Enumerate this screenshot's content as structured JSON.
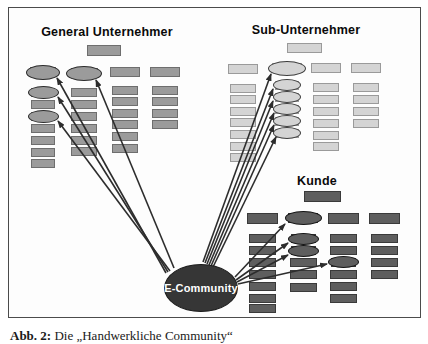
{
  "caption": {
    "label": "Abb. 2:",
    "text": " Die „Handwerkliche Community“"
  },
  "colors": {
    "page_bg": "#ffffff",
    "frame_border": "#4b4b4b",
    "frame_bg": "#fdfdfd",
    "arrow": "#2d2d2d"
  },
  "diagram": {
    "hub": {
      "label": "E-Community",
      "cx": 201,
      "cy": 288,
      "rx": 37,
      "ry": 24,
      "fill": "#363636",
      "border": "#1c1c1c",
      "text_color": "#ffffff"
    },
    "groups": [
      {
        "id": "general-unternehmer",
        "title": "General Unternehmer",
        "title_cx": 107,
        "title_top": 25,
        "fill": "#9b9b9b",
        "rect_border": "#6e6e6e",
        "ellipse_border": "#2b2b2b",
        "header": {
          "x": 87,
          "y": 45,
          "w": 34,
          "h": 11
        },
        "columns": [
          {
            "cx": 43,
            "nodes": [
              {
                "y": 72,
                "t": "e",
                "w": 26,
                "h": 10,
                "ew": 34,
                "eh": 15
              },
              {
                "y": 92.5,
                "t": "e",
                "w": 24,
                "h": 9,
                "ew": 31,
                "eh": 13
              },
              {
                "y": 104,
                "t": "r",
                "w": 24,
                "h": 9
              },
              {
                "y": 116,
                "t": "e",
                "w": 24,
                "h": 9,
                "ew": 31,
                "eh": 13
              },
              {
                "y": 128.5,
                "t": "r",
                "w": 24,
                "h": 9
              },
              {
                "y": 140.5,
                "t": "r",
                "w": 24,
                "h": 9
              },
              {
                "y": 152.5,
                "t": "r",
                "w": 24,
                "h": 9
              },
              {
                "y": 163.5,
                "t": "r",
                "w": 24,
                "h": 9
              }
            ]
          },
          {
            "cx": 84,
            "nodes": [
              {
                "y": 73,
                "t": "e",
                "w": 27,
                "h": 10,
                "ew": 36,
                "eh": 15
              },
              {
                "y": 92.5,
                "t": "r",
                "w": 26,
                "h": 9
              },
              {
                "y": 104,
                "t": "r",
                "w": 26,
                "h": 9
              },
              {
                "y": 116,
                "t": "r",
                "w": 26,
                "h": 9
              },
              {
                "y": 128,
                "t": "r",
                "w": 26,
                "h": 9
              },
              {
                "y": 140,
                "t": "r",
                "w": 26,
                "h": 9
              },
              {
                "y": 151.5,
                "t": "r",
                "w": 26,
                "h": 9
              }
            ]
          },
          {
            "cx": 125,
            "nodes": [
              {
                "y": 71.5,
                "t": "r",
                "w": 30,
                "h": 10
              },
              {
                "y": 90,
                "t": "r",
                "w": 26,
                "h": 9
              },
              {
                "y": 101.5,
                "t": "r",
                "w": 26,
                "h": 9
              },
              {
                "y": 113,
                "t": "r",
                "w": 26,
                "h": 9
              },
              {
                "y": 124.5,
                "t": "r",
                "w": 26,
                "h": 9
              },
              {
                "y": 136.5,
                "t": "r",
                "w": 26,
                "h": 9
              },
              {
                "y": 148.5,
                "t": "r",
                "w": 26,
                "h": 9
              }
            ]
          },
          {
            "cx": 165,
            "nodes": [
              {
                "y": 71.5,
                "t": "r",
                "w": 30,
                "h": 10
              },
              {
                "y": 90,
                "t": "r",
                "w": 26,
                "h": 9
              },
              {
                "y": 101.5,
                "t": "r",
                "w": 26,
                "h": 9
              },
              {
                "y": 113,
                "t": "r",
                "w": 26,
                "h": 9
              },
              {
                "y": 124.5,
                "t": "r",
                "w": 26,
                "h": 9
              }
            ]
          }
        ]
      },
      {
        "id": "sub-unternehmer",
        "title": "Sub-Unternehmer",
        "title_cx": 306,
        "title_top": 23,
        "fill": "#d4d4d4",
        "rect_border": "#9a9a9a",
        "ellipse_border": "#3e3e3e",
        "header": {
          "x": 287,
          "y": 43,
          "w": 35,
          "h": 10
        },
        "columns": [
          {
            "cx": 243,
            "nodes": [
              {
                "y": 69,
                "t": "r",
                "w": 30,
                "h": 10
              },
              {
                "y": 88,
                "t": "r",
                "w": 26,
                "h": 9
              },
              {
                "y": 99.5,
                "t": "r",
                "w": 26,
                "h": 9
              },
              {
                "y": 111,
                "t": "r",
                "w": 26,
                "h": 9
              },
              {
                "y": 122.5,
                "t": "r",
                "w": 26,
                "h": 9
              },
              {
                "y": 134.5,
                "t": "r",
                "w": 26,
                "h": 9
              },
              {
                "y": 146,
                "t": "r",
                "w": 26,
                "h": 9
              },
              {
                "y": 157.5,
                "t": "r",
                "w": 26,
                "h": 9
              }
            ]
          },
          {
            "cx": 287,
            "nodes": [
              {
                "y": 68,
                "t": "e",
                "w": 30,
                "h": 10,
                "ew": 38,
                "eh": 15
              },
              {
                "y": 85,
                "t": "e",
                "w": 24,
                "h": 9,
                "ew": 28,
                "eh": 12
              },
              {
                "y": 97,
                "t": "e",
                "w": 24,
                "h": 9,
                "ew": 28,
                "eh": 12
              },
              {
                "y": 109,
                "t": "e",
                "w": 24,
                "h": 9,
                "ew": 28,
                "eh": 12
              },
              {
                "y": 121,
                "t": "e",
                "w": 24,
                "h": 9,
                "ew": 28,
                "eh": 12
              },
              {
                "y": 133,
                "t": "e",
                "w": 24,
                "h": 9,
                "ew": 28,
                "eh": 12
              }
            ]
          },
          {
            "cx": 326,
            "nodes": [
              {
                "y": 67.5,
                "t": "r",
                "w": 30,
                "h": 10
              },
              {
                "y": 87,
                "t": "r",
                "w": 26,
                "h": 9
              },
              {
                "y": 99,
                "t": "r",
                "w": 26,
                "h": 9
              },
              {
                "y": 111,
                "t": "r",
                "w": 26,
                "h": 9
              },
              {
                "y": 123,
                "t": "r",
                "w": 26,
                "h": 9
              },
              {
                "y": 135,
                "t": "r",
                "w": 26,
                "h": 9
              },
              {
                "y": 146.5,
                "t": "r",
                "w": 26,
                "h": 9
              }
            ]
          },
          {
            "cx": 366,
            "nodes": [
              {
                "y": 67.5,
                "t": "r",
                "w": 30,
                "h": 10
              },
              {
                "y": 87,
                "t": "r",
                "w": 26,
                "h": 9
              },
              {
                "y": 99,
                "t": "r",
                "w": 26,
                "h": 9
              },
              {
                "y": 111,
                "t": "r",
                "w": 26,
                "h": 9
              },
              {
                "y": 123,
                "t": "r",
                "w": 26,
                "h": 9
              }
            ]
          }
        ]
      },
      {
        "id": "kunde",
        "title": "Kunde",
        "title_cx": 317,
        "title_top": 174,
        "fill": "#5e5e5e",
        "rect_border": "#3a3a3a",
        "ellipse_border": "#141414",
        "header": {
          "x": 304,
          "y": 191,
          "w": 37,
          "h": 11
        },
        "columns": [
          {
            "cx": 262,
            "nodes": [
              {
                "y": 218,
                "t": "r",
                "w": 31,
                "h": 11
              },
              {
                "y": 238,
                "t": "r",
                "w": 27,
                "h": 9
              },
              {
                "y": 250,
                "t": "r",
                "w": 27,
                "h": 9
              },
              {
                "y": 262,
                "t": "r",
                "w": 27,
                "h": 9
              },
              {
                "y": 274,
                "t": "r",
                "w": 27,
                "h": 9
              },
              {
                "y": 286,
                "t": "r",
                "w": 27,
                "h": 9
              },
              {
                "y": 298,
                "t": "r",
                "w": 27,
                "h": 9
              },
              {
                "y": 308.5,
                "t": "r",
                "w": 27,
                "h": 9
              }
            ]
          },
          {
            "cx": 303,
            "nodes": [
              {
                "y": 218,
                "t": "e",
                "w": 30,
                "h": 10,
                "ew": 37,
                "eh": 14
              },
              {
                "y": 238.5,
                "t": "e",
                "w": 25,
                "h": 9,
                "ew": 31,
                "eh": 12
              },
              {
                "y": 250.5,
                "t": "e",
                "w": 25,
                "h": 9,
                "ew": 31,
                "eh": 12
              },
              {
                "y": 262.5,
                "t": "r",
                "w": 27,
                "h": 9
              },
              {
                "y": 274.5,
                "t": "r",
                "w": 27,
                "h": 9
              },
              {
                "y": 287,
                "t": "r",
                "w": 27,
                "h": 9
              }
            ]
          },
          {
            "cx": 343,
            "nodes": [
              {
                "y": 218,
                "t": "r",
                "w": 31,
                "h": 11
              },
              {
                "y": 238,
                "t": "r",
                "w": 27,
                "h": 9
              },
              {
                "y": 250,
                "t": "r",
                "w": 27,
                "h": 9
              },
              {
                "y": 262,
                "t": "e",
                "w": 25,
                "h": 9,
                "ew": 31,
                "eh": 12
              },
              {
                "y": 274,
                "t": "r",
                "w": 27,
                "h": 9
              },
              {
                "y": 286,
                "t": "r",
                "w": 27,
                "h": 9
              },
              {
                "y": 298,
                "t": "r",
                "w": 27,
                "h": 9
              }
            ]
          },
          {
            "cx": 384,
            "nodes": [
              {
                "y": 218,
                "t": "r",
                "w": 31,
                "h": 11
              },
              {
                "y": 238,
                "t": "r",
                "w": 27,
                "h": 9
              },
              {
                "y": 250,
                "t": "r",
                "w": 27,
                "h": 9
              },
              {
                "y": 262,
                "t": "r",
                "w": 27,
                "h": 9
              },
              {
                "y": 274,
                "t": "r",
                "w": 27,
                "h": 9
              }
            ]
          }
        ]
      }
    ],
    "arrows": [
      {
        "x1": 166,
        "y1": 273,
        "x2": 57,
        "y2": 78
      },
      {
        "x1": 168,
        "y1": 272,
        "x2": 58,
        "y2": 97
      },
      {
        "x1": 170,
        "y1": 271,
        "x2": 58,
        "y2": 121
      },
      {
        "x1": 174,
        "y1": 268,
        "x2": 96,
        "y2": 80
      },
      {
        "x1": 203,
        "y1": 262,
        "x2": 271,
        "y2": 74
      },
      {
        "x1": 205,
        "y1": 263,
        "x2": 273,
        "y2": 89
      },
      {
        "x1": 207,
        "y1": 264,
        "x2": 273,
        "y2": 101
      },
      {
        "x1": 209,
        "y1": 265,
        "x2": 274,
        "y2": 113
      },
      {
        "x1": 211,
        "y1": 266,
        "x2": 274,
        "y2": 125
      },
      {
        "x1": 213,
        "y1": 267,
        "x2": 276,
        "y2": 137
      },
      {
        "x1": 235,
        "y1": 277,
        "x2": 285,
        "y2": 224
      },
      {
        "x1": 236,
        "y1": 280,
        "x2": 288,
        "y2": 243
      },
      {
        "x1": 237,
        "y1": 282,
        "x2": 288,
        "y2": 255
      },
      {
        "x1": 238,
        "y1": 284,
        "x2": 327,
        "y2": 264
      }
    ]
  }
}
